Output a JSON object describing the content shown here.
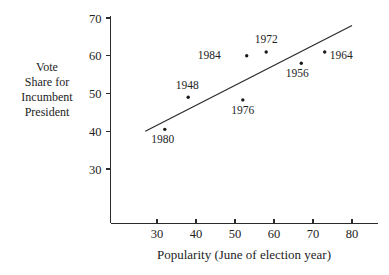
{
  "chart_data": {
    "type": "scatter",
    "title": "",
    "xlabel": "Popularity (June of election year)",
    "ylabel": "Vote Share for Incumbent President",
    "ylabel_lines": [
      "Vote",
      "Share for",
      "Incumbent",
      "President"
    ],
    "xlim": [
      22,
      84
    ],
    "ylim": [
      25,
      71
    ],
    "xticks": [
      30,
      40,
      50,
      60,
      70,
      80
    ],
    "xtick_labels": [
      "30",
      "40",
      "50",
      "60",
      "70",
      "80"
    ],
    "yticks": [
      30,
      40,
      50,
      60,
      70
    ],
    "ytick_labels": [
      "30",
      "40",
      "50",
      "60",
      "70"
    ],
    "grid": false,
    "legend": false,
    "points": [
      {
        "label": "1980",
        "x": 32,
        "y": 40.5,
        "label_dx": -2,
        "label_dy": 14
      },
      {
        "label": "1948",
        "x": 38,
        "y": 49.0,
        "label_dx": -1,
        "label_dy": -8
      },
      {
        "label": "1976",
        "x": 52,
        "y": 48.3,
        "label_dx": 0,
        "label_dy": 14
      },
      {
        "label": "1984",
        "x": 53,
        "y": 60.0,
        "label_dx": -26,
        "label_dy": 3
      },
      {
        "label": "1972",
        "x": 58,
        "y": 61.0,
        "label_dx": 0,
        "label_dy": -9
      },
      {
        "label": "1956",
        "x": 67,
        "y": 58.0,
        "label_dx": -4,
        "label_dy": 14
      },
      {
        "label": "1964",
        "x": 73,
        "y": 61.0,
        "label_dx": 5,
        "label_dy": 7
      }
    ],
    "trend_line": {
      "name": "least-squares regression line",
      "x1": 27,
      "y1": 40.0,
      "x2": 80,
      "y2": 68.0
    }
  },
  "figure": {
    "background_color": "#ffffff",
    "ink_color": "#1a1a1a"
  }
}
